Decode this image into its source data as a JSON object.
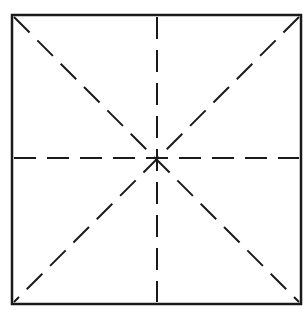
{
  "diagram": {
    "type": "square-with-dashed-guides",
    "colors": {
      "stroke": "#1a1a1a",
      "background": "#ffffff"
    },
    "square": {
      "x1": 12,
      "y1": 15,
      "x2": 301,
      "y2": 304
    },
    "center": {
      "x": 157,
      "y": 158
    },
    "dashed_lines": [
      {
        "name": "diagonal-top-left-to-bottom-right",
        "x1": 14,
        "y1": 17,
        "x2": 299,
        "y2": 302
      },
      {
        "name": "diagonal-top-right-to-bottom-left",
        "x1": 299,
        "y1": 17,
        "x2": 14,
        "y2": 302
      },
      {
        "name": "vertical-center",
        "x1": 157,
        "y1": 17,
        "x2": 157,
        "y2": 302
      },
      {
        "name": "horizontal-center",
        "x1": 14,
        "y1": 158,
        "x2": 299,
        "y2": 158
      }
    ]
  }
}
